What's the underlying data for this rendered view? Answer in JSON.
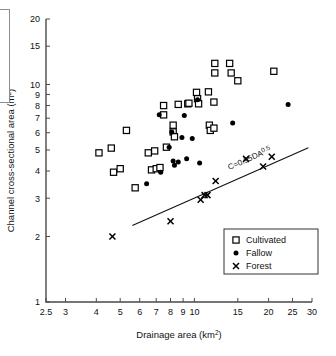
{
  "figure": {
    "background": "#ffffff",
    "foreground": "#111111"
  },
  "axes": {
    "x_title_main": "Drainage area (km",
    "x_title_sup": "2",
    "x_title_tail": ")",
    "y_title_main": "Channel cross-sectional area (m",
    "y_title_sup": "2",
    "y_title_tail": ")"
  },
  "legend": {
    "items": [
      {
        "label": "Cultivated",
        "marker": "open-square"
      },
      {
        "label": "Fallow",
        "marker": "filled-circle"
      },
      {
        "label": "Forest",
        "marker": "cross"
      }
    ]
  },
  "annotation": {
    "equation_main": "C=0.95DA",
    "equation_sup": "0.5"
  },
  "chart_data": {
    "type": "scatter",
    "title": "",
    "xlabel": "Drainage area (km^2)",
    "ylabel": "Channel cross-sectional area (m^2)",
    "xscale": "log",
    "yscale": "log",
    "xlim": [
      2.5,
      30
    ],
    "ylim": [
      1,
      20
    ],
    "grid": false,
    "legend_position": "lower-right",
    "xticks": [
      2.5,
      3,
      4,
      5,
      6,
      7,
      8,
      9,
      10,
      15,
      20,
      25,
      30
    ],
    "xticklabels": [
      "2.5",
      "3",
      "4",
      "5",
      "6",
      "7",
      "8",
      "9",
      "10",
      "15",
      "20",
      "25",
      "30"
    ],
    "yticks": [
      1,
      2,
      3,
      4,
      5,
      6,
      7,
      8,
      9,
      10,
      15,
      20
    ],
    "yticklabels": [
      "1",
      "2",
      "3",
      "4",
      "5",
      "6",
      "7",
      "8",
      "9",
      "10",
      "15",
      "20"
    ],
    "series": [
      {
        "name": "Cultivated",
        "marker": "open-square",
        "points": [
          [
            4.1,
            4.85
          ],
          [
            4.6,
            5.1
          ],
          [
            4.7,
            3.95
          ],
          [
            5.0,
            4.1
          ],
          [
            5.3,
            6.15
          ],
          [
            5.75,
            3.35
          ],
          [
            6.5,
            4.85
          ],
          [
            6.9,
            4.95
          ],
          [
            6.7,
            4.05
          ],
          [
            7.0,
            4.1
          ],
          [
            7.25,
            4.15
          ],
          [
            7.5,
            8.0
          ],
          [
            7.5,
            7.25
          ],
          [
            7.7,
            5.15
          ],
          [
            8.2,
            6.5
          ],
          [
            8.2,
            6.05
          ],
          [
            8.3,
            5.75
          ],
          [
            8.6,
            8.1
          ],
          [
            9.4,
            8.15
          ],
          [
            9.5,
            8.2
          ],
          [
            10.2,
            9.2
          ],
          [
            10.3,
            8.6
          ],
          [
            10.4,
            8.15
          ],
          [
            11.4,
            9.25
          ],
          [
            11.5,
            6.5
          ],
          [
            11.6,
            6.15
          ],
          [
            12.0,
            6.3
          ],
          [
            12.0,
            8.3
          ],
          [
            12.1,
            12.5
          ],
          [
            12.1,
            11.3
          ],
          [
            13.9,
            12.5
          ],
          [
            14.1,
            11.3
          ],
          [
            15.0,
            10.4
          ],
          [
            21.0,
            11.5
          ]
        ]
      },
      {
        "name": "Fallow",
        "marker": "filled-circle",
        "points": [
          [
            6.4,
            3.5
          ],
          [
            7.3,
            3.95
          ],
          [
            7.2,
            7.25
          ],
          [
            7.9,
            5.15
          ],
          [
            8.1,
            6.05
          ],
          [
            8.2,
            4.45
          ],
          [
            8.3,
            4.25
          ],
          [
            8.6,
            4.4
          ],
          [
            8.9,
            5.7
          ],
          [
            9.1,
            7.2
          ],
          [
            9.3,
            4.55
          ],
          [
            9.8,
            5.65
          ],
          [
            10.3,
            8.5
          ],
          [
            10.5,
            4.35
          ],
          [
            14.3,
            6.65
          ],
          [
            24.0,
            8.1
          ]
        ]
      },
      {
        "name": "Forest",
        "marker": "cross",
        "points": [
          [
            4.65,
            2.0
          ],
          [
            8.0,
            2.35
          ],
          [
            10.6,
            2.95
          ],
          [
            11.0,
            3.1
          ],
          [
            11.3,
            3.1
          ],
          [
            12.2,
            3.6
          ],
          [
            16.2,
            4.55
          ],
          [
            19.0,
            4.2
          ],
          [
            20.6,
            4.65
          ]
        ]
      }
    ],
    "fit_line": {
      "label": "C=0.95DA^0.5",
      "equation": "C = 0.95 * DA^0.5",
      "coefficient": 0.95,
      "exponent": 0.5,
      "x_range": [
        5.6,
        29.0
      ]
    }
  }
}
